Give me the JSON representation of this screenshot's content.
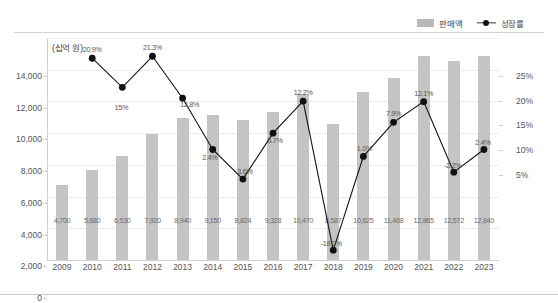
{
  "legend": {
    "items": [
      {
        "label": "판매액",
        "type": "bar",
        "color": "#b9b9b9"
      },
      {
        "label": "성장률",
        "type": "line-marker",
        "color": "#111111"
      }
    ]
  },
  "unit_note": "(십억 원)",
  "axes": {
    "left": {
      "ticks": [
        "0",
        "2,000",
        "4,000",
        "6,000",
        "8,000",
        "10,000",
        "12,000",
        "14,000"
      ],
      "min": 0,
      "max": 14000,
      "step": 2000
    },
    "right": {
      "ticks": [
        "5%",
        "10%",
        "15%",
        "20%",
        "25%"
      ],
      "min": -20,
      "max": 25,
      "step": 5
    },
    "x": {
      "ticks": [
        "2009",
        "2010",
        "2011",
        "2012",
        "2013",
        "2014",
        "2015",
        "2016",
        "2017",
        "2018",
        "2019",
        "2020",
        "2021",
        "2022",
        "2023"
      ]
    }
  },
  "chart_data": {
    "type": "bar",
    "title": "",
    "xlabel": "",
    "ylabel": "(십억 원)",
    "ylim": [
      0,
      14000
    ],
    "y2lim": [
      -20,
      25
    ],
    "grid": true,
    "legend_position": "top-right",
    "categories": [
      "2009",
      "2010",
      "2011",
      "2012",
      "2013",
      "2014",
      "2015",
      "2016",
      "2017",
      "2018",
      "2019",
      "2020",
      "2021",
      "2022",
      "2023"
    ],
    "series": [
      {
        "name": "판매액",
        "type": "bar",
        "axis": "left",
        "unit": "십억 원",
        "color": "#c4c4c4",
        "values": [
          4700,
          5680,
          6530,
          7920,
          8940,
          9150,
          8824,
          9328,
          10470,
          8587,
          10625,
          11468,
          12865,
          12572,
          12840
        ],
        "labels": [
          "4,700",
          "5,680",
          "6,530",
          "7,920",
          "8,940",
          "9,150",
          "8,824",
          "9,328",
          "10,470",
          "8,587",
          "10,625",
          "11,468",
          "12,865",
          "12,572",
          "12,840"
        ]
      },
      {
        "name": "성장률",
        "type": "line",
        "axis": "right",
        "unit": "%",
        "color": "#111111",
        "values": [
          null,
          20.9,
          15.0,
          21.3,
          12.8,
          2.4,
          -3.6,
          5.7,
          12.2,
          -18.0,
          1.0,
          7.9,
          12.1,
          -2.2,
          2.4
        ],
        "labels": [
          null,
          "20.9%",
          "15%",
          "21.3%",
          "12.8%",
          "2.4%",
          "-3.6%",
          "5.7%",
          "12.2%",
          "-18.0%",
          "1.0%",
          "7.9%",
          "12.1%",
          "-2.2%",
          "2.4%"
        ]
      }
    ]
  }
}
